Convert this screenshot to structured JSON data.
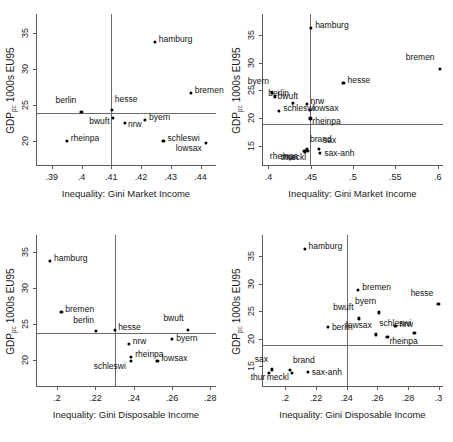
{
  "figure": {
    "ylabel_main": "GDP",
    "ylabel_sub": "pc",
    "ylabel_tail": " 1000s EU95",
    "xlabel_market": "Inequality: Gini Market Income",
    "xlabel_disposable": "Inequality: Gini Disposable Income",
    "marker_color": "#000000",
    "axis_color": "#5a5a5a",
    "refline_color": "#6b6b6b",
    "background": "#ffffff"
  },
  "chart_data": [
    {
      "type": "scatter",
      "panel": "top-left",
      "title": "",
      "xlabel": "Inequality: Gini Market Income",
      "ylabel": "GDP_pc 1000s EU95",
      "xlim": [
        0.385,
        0.4455
      ],
      "ylim": [
        16.6,
        37.6
      ],
      "xticks": [
        0.39,
        0.4,
        0.41,
        0.42,
        0.43,
        0.44
      ],
      "xticklabels": [
        ".39",
        ".4",
        ".41",
        ".42",
        ".43",
        ".44"
      ],
      "yticks": [
        20,
        25,
        30,
        35
      ],
      "yticklabels": [
        "20",
        "25",
        "30",
        "35"
      ],
      "grid": false,
      "reflines": {
        "x": 0.41,
        "y": 23.9
      },
      "points": [
        {
          "label": "hamburg",
          "x": 0.4246,
          "y": 33.8,
          "lx": 4,
          "ly": -3
        },
        {
          "label": "bremen",
          "x": 0.4367,
          "y": 26.7,
          "lx": 4,
          "ly": -3
        },
        {
          "label": "hesse",
          "x": 0.4101,
          "y": 24.3,
          "lx": 3,
          "ly": -11
        },
        {
          "label": "berlin",
          "x": 0.3999,
          "y": 24.1,
          "lx": -4,
          "ly": -12
        },
        {
          "label": "bwuft",
          "x": 0.4104,
          "y": 23.2,
          "lx": -2,
          "ly": 3
        },
        {
          "label": "nrw",
          "x": 0.4146,
          "y": 22.6,
          "lx": 3,
          "ly": 1
        },
        {
          "label": "byern",
          "x": 0.4213,
          "y": 23.0,
          "lx": 4,
          "ly": -3
        },
        {
          "label": "schleswi",
          "x": 0.4275,
          "y": 20.1,
          "lx": 4,
          "ly": -3
        },
        {
          "label": "lowsax",
          "x": 0.4417,
          "y": 19.8,
          "lx": -3,
          "ly": 5
        },
        {
          "label": "rheinpa",
          "x": 0.395,
          "y": 20.1,
          "lx": 4,
          "ly": -3
        }
      ]
    },
    {
      "type": "scatter",
      "panel": "top-right",
      "title": "",
      "xlabel": "Inequality: Gini Market Income",
      "ylabel": "GDP_pc 1000s EU95",
      "xlim": [
        0.3935,
        0.6075
      ],
      "ylim": [
        11.3,
        38.8
      ],
      "xticks": [
        0.4,
        0.45,
        0.5,
        0.55,
        0.6
      ],
      "xticklabels": [
        ".4",
        ".45",
        ".5",
        ".55",
        ".6"
      ],
      "yticks": [
        15,
        20,
        25,
        30,
        35
      ],
      "yticklabels": [
        "15",
        "20",
        "25",
        "30",
        "35"
      ],
      "grid": false,
      "reflines": {
        "x": 0.4487,
        "y": 18.9
      },
      "points": [
        {
          "label": "hamburg",
          "x": 0.4504,
          "y": 36.3,
          "lx": 4,
          "ly": -3
        },
        {
          "label": "bremen",
          "x": 0.6023,
          "y": 28.9,
          "lx": -4,
          "ly": -12
        },
        {
          "label": "hesse",
          "x": 0.4886,
          "y": 26.3,
          "lx": 4,
          "ly": -3
        },
        {
          "label": "byern",
          "x": 0.4042,
          "y": 24.6,
          "lx": -2,
          "ly": -11
        },
        {
          "label": "bwuft",
          "x": 0.4072,
          "y": 23.9,
          "lx": 3,
          "ly": 0
        },
        {
          "label": "berlin",
          "x": 0.429,
          "y": 22.7,
          "lx": -3,
          "ly": -10
        },
        {
          "label": "nrw",
          "x": 0.445,
          "y": 22.5,
          "lx": 4,
          "ly": -3
        },
        {
          "label": "lowsax",
          "x": 0.4486,
          "y": 21.4,
          "lx": 3,
          "ly": -2
        },
        {
          "label": "schleswi",
          "x": 0.4126,
          "y": 21.3,
          "lx": 4,
          "ly": -3
        },
        {
          "label": "rheinpa",
          "x": 0.4495,
          "y": 19.9,
          "lx": 2,
          "ly": 3
        },
        {
          "label": "brand",
          "x": 0.4455,
          "y": 14.3,
          "lx": 3,
          "ly": -10
        },
        {
          "label": "sax",
          "x": 0.4598,
          "y": 14.4,
          "lx": 4,
          "ly": -9
        },
        {
          "label": "sax-anh",
          "x": 0.4611,
          "y": 13.7,
          "lx": 4,
          "ly": 0
        },
        {
          "label": "rheinpa",
          "x": 0.4434,
          "y": 13.9,
          "lx": -6,
          "ly": 4
        },
        {
          "label": "meckl",
          "x": 0.447,
          "y": 14.1,
          "lx": -1,
          "ly": 6
        },
        {
          "label": "thur",
          "x": 0.4424,
          "y": 14.0,
          "lx": -8,
          "ly": 6
        }
      ]
    },
    {
      "type": "scatter",
      "panel": "bottom-left",
      "title": "",
      "xlabel": "Inequality: Gini Disposable Income",
      "ylabel": "GDP_pc 1000s EU95",
      "xlim": [
        0.1895,
        0.2835
      ],
      "ylim": [
        16.3,
        37.4
      ],
      "xticks": [
        0.2,
        0.22,
        0.24,
        0.26,
        0.28
      ],
      "xticklabels": [
        ".2",
        ".22",
        ".24",
        ".26",
        ".28"
      ],
      "yticks": [
        20,
        25,
        30,
        35
      ],
      "yticklabels": [
        "20",
        "25",
        "30",
        "35"
      ],
      "grid": false,
      "reflines": {
        "x": 0.2301,
        "y": 23.8
      },
      "points": [
        {
          "label": "hamburg",
          "x": 0.1963,
          "y": 33.8,
          "lx": 4,
          "ly": -3
        },
        {
          "label": "bremen",
          "x": 0.2022,
          "y": 26.7,
          "lx": 4,
          "ly": -3
        },
        {
          "label": "berlin",
          "x": 0.2203,
          "y": 24.1,
          "lx": -1,
          "ly": -11
        },
        {
          "label": "hesse",
          "x": 0.2303,
          "y": 24.2,
          "lx": 3,
          "ly": -3
        },
        {
          "label": "bwuft",
          "x": 0.2682,
          "y": 24.2,
          "lx": -3,
          "ly": -12
        },
        {
          "label": "byern",
          "x": 0.2601,
          "y": 23.0,
          "lx": 4,
          "ly": -1
        },
        {
          "label": "nrw",
          "x": 0.2374,
          "y": 22.3,
          "lx": 4,
          "ly": -3
        },
        {
          "label": "rheinpa",
          "x": 0.2387,
          "y": 20.5,
          "lx": 4,
          "ly": -3
        },
        {
          "label": "schleswi",
          "x": 0.2385,
          "y": 19.9,
          "lx": -4,
          "ly": 5
        },
        {
          "label": "lowsax",
          "x": 0.2524,
          "y": 19.9,
          "lx": 4,
          "ly": -3
        }
      ]
    },
    {
      "type": "scatter",
      "panel": "bottom-right",
      "title": "",
      "xlabel": "Inequality: Gini Disposable Income",
      "ylabel": "GDP_pc 1000s EU95",
      "xlim": [
        0.1855,
        0.3035
      ],
      "ylim": [
        11.2,
        38.9
      ],
      "xticks": [
        0.2,
        0.22,
        0.24,
        0.26,
        0.28,
        0.3
      ],
      "xticklabels": [
        ".2",
        ".22",
        ".24",
        ".26",
        ".28",
        ".3"
      ],
      "yticks": [
        15,
        20,
        25,
        30,
        35
      ],
      "yticklabels": [
        "15",
        "20",
        "25",
        "30",
        "35"
      ],
      "grid": false,
      "reflines": {
        "x": 0.24,
        "y": 18.9
      },
      "points": [
        {
          "label": "hamburg",
          "x": 0.2126,
          "y": 36.3,
          "lx": 4,
          "ly": -3
        },
        {
          "label": "bremen",
          "x": 0.2476,
          "y": 28.9,
          "lx": 4,
          "ly": -3
        },
        {
          "label": "byern",
          "x": 0.2613,
          "y": 24.8,
          "lx": -2,
          "ly": -11
        },
        {
          "label": "hesse",
          "x": 0.2998,
          "y": 26.3,
          "lx": -4,
          "ly": -11
        },
        {
          "label": "bwuft",
          "x": 0.2478,
          "y": 23.7,
          "lx": -4,
          "ly": -11
        },
        {
          "label": "berlin",
          "x": 0.2278,
          "y": 22.2,
          "lx": 4,
          "ly": 0
        },
        {
          "label": "nrw",
          "x": 0.2718,
          "y": 22.4,
          "lx": 4,
          "ly": -2
        },
        {
          "label": "schleswi",
          "x": 0.2842,
          "y": 21.1,
          "lx": -2,
          "ly": -10
        },
        {
          "label": "lowsax",
          "x": 0.259,
          "y": 20.8,
          "lx": -3,
          "ly": -9
        },
        {
          "label": "rheinpa",
          "x": 0.2666,
          "y": 20.3,
          "lx": 2,
          "ly": 4
        },
        {
          "label": "sax",
          "x": 0.1913,
          "y": 14.4,
          "lx": -3,
          "ly": -10
        },
        {
          "label": "thur",
          "x": 0.1896,
          "y": 13.8,
          "lx": -3,
          "ly": 4
        },
        {
          "label": "brand",
          "x": 0.2031,
          "y": 14.3,
          "lx": 3,
          "ly": -10
        },
        {
          "label": "meckl",
          "x": 0.2043,
          "y": 13.8,
          "lx": -2,
          "ly": 4
        },
        {
          "label": "sax-anh",
          "x": 0.2147,
          "y": 13.9,
          "lx": 4,
          "ly": 0
        }
      ]
    }
  ]
}
